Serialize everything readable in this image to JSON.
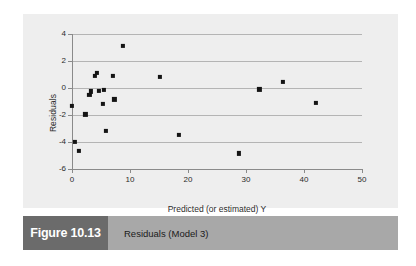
{
  "figure": {
    "number_label": "Figure 10.13",
    "caption": "Residuals (Model 3)",
    "number_box_color": "#6b6b6b",
    "caption_bar_color": "#a8a8a8",
    "panel_color": "#eeeeee"
  },
  "chart_data": {
    "type": "scatter",
    "title": "",
    "xlabel": "Predicted (or estimated) Y",
    "ylabel": "Residuals",
    "xlim": [
      0,
      50
    ],
    "ylim": [
      -6,
      4
    ],
    "xticks": [
      0,
      10,
      20,
      30,
      40,
      50
    ],
    "yticks": [
      4,
      2,
      0,
      -2,
      -4,
      -6
    ],
    "xtick_labels": [
      "0",
      "10",
      "20",
      "30",
      "40",
      "50"
    ],
    "ytick_labels": [
      "4",
      "2",
      "0",
      "-2",
      "-4",
      "-6"
    ],
    "grid": "horizontal",
    "legend": "none",
    "marker": "square",
    "marker_color": "#141414",
    "series": [
      {
        "name": "Residuals",
        "points": [
          [
            0.0,
            -1.3
          ],
          [
            0.5,
            -4.0
          ],
          [
            1.2,
            -4.65
          ],
          [
            2.3,
            -1.95
          ],
          [
            3.0,
            -0.5
          ],
          [
            3.3,
            -0.25
          ],
          [
            4.0,
            0.9
          ],
          [
            4.3,
            1.1
          ],
          [
            4.6,
            -0.2
          ],
          [
            5.3,
            -1.2
          ],
          [
            5.5,
            -0.15
          ],
          [
            5.8,
            -3.15
          ],
          [
            7.0,
            0.9
          ],
          [
            7.3,
            -0.85
          ],
          [
            8.8,
            3.1
          ],
          [
            15.2,
            0.85
          ],
          [
            18.5,
            -3.5
          ],
          [
            28.8,
            -4.85
          ],
          [
            32.3,
            -0.1
          ],
          [
            36.4,
            0.45
          ],
          [
            42.1,
            -1.1
          ]
        ]
      }
    ]
  }
}
